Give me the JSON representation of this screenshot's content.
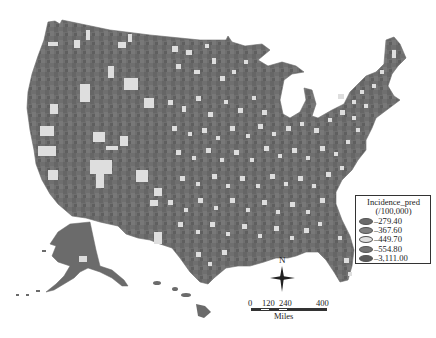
{
  "map": {
    "title": "Predicted incidence by U.S. county",
    "colors": {
      "base": "#6f6f6f",
      "dark": "#5e5e5e",
      "mid": "#7a7a7a",
      "light": "#dcdcdc"
    }
  },
  "legend": {
    "title": "Incidence_pred",
    "unit": "(/100,000)",
    "classes": [
      {
        "label": "–279.40",
        "color": "#6b6b6b"
      },
      {
        "label": "–367.60",
        "color": "#808080"
      },
      {
        "label": "–449.70",
        "color": "#e0e0e0"
      },
      {
        "label": "–554.80",
        "color": "#747474"
      },
      {
        "label": "–3,111.00",
        "color": "#5a5a5a"
      }
    ]
  },
  "north_arrow": {
    "label": "N"
  },
  "scale_bar": {
    "ticks": [
      "0",
      "120",
      "240",
      "400"
    ],
    "units": "Miles"
  }
}
